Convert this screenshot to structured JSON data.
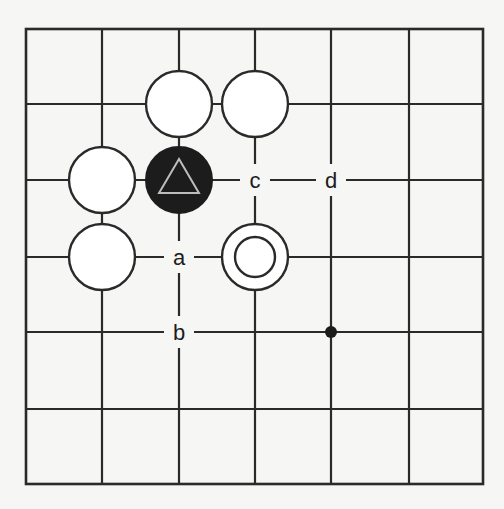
{
  "board": {
    "size_shown": 7,
    "x_coords": [
      26,
      102,
      179,
      255,
      331,
      409,
      483
    ],
    "y_coords": [
      29,
      104,
      180,
      257,
      332,
      409,
      484
    ],
    "stone_radius": 33,
    "colors": {
      "line": "#2a2a2a",
      "black": "#1c1c1c",
      "white": "#ffffff",
      "background": "#f6f6f4",
      "triangle": "#bdbdbd"
    }
  },
  "stones": [
    {
      "color": "white",
      "col": 2,
      "row": 1,
      "marker": ""
    },
    {
      "color": "white",
      "col": 3,
      "row": 1,
      "marker": ""
    },
    {
      "color": "white",
      "col": 1,
      "row": 2,
      "marker": ""
    },
    {
      "color": "black",
      "col": 2,
      "row": 2,
      "marker": "triangle"
    },
    {
      "color": "white",
      "col": 1,
      "row": 3,
      "marker": ""
    },
    {
      "color": "white",
      "col": 3,
      "row": 3,
      "marker": "circle"
    }
  ],
  "hoshi": [
    {
      "col": 4,
      "row": 4
    }
  ],
  "labels": [
    {
      "text": "c",
      "col": 3,
      "row": 2
    },
    {
      "text": "d",
      "col": 4,
      "row": 2
    },
    {
      "text": "a",
      "col": 2,
      "row": 3
    },
    {
      "text": "b",
      "col": 2,
      "row": 4
    }
  ]
}
